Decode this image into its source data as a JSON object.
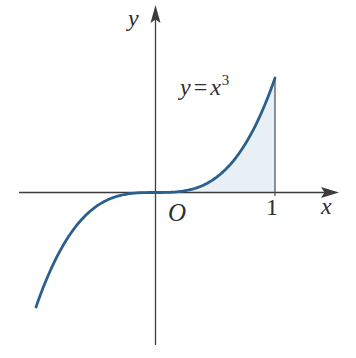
{
  "figure": {
    "axis_labels": {
      "x": "x",
      "y": "y"
    },
    "origin_label": "O",
    "x_tick_label": "1",
    "equation": {
      "lhs": "y",
      "equals": "=",
      "rhs_base": "x",
      "rhs_exponent": "3"
    }
  },
  "colors": {
    "background": "#ffffff",
    "curve": "#2b5f8e",
    "area_fill": "#e8eff5",
    "axis": "#3c3c3c",
    "text": "#2e2e2e"
  },
  "chart_data": {
    "type": "line",
    "title": "",
    "function": "y = x^3",
    "exponent": 3,
    "x_range": [
      -1,
      1
    ],
    "series": [
      {
        "name": "y = x^3",
        "x": [
          -1,
          -0.8,
          -0.6,
          -0.4,
          -0.2,
          0,
          0.2,
          0.4,
          0.6,
          0.8,
          1
        ],
        "y": [
          -1,
          -0.512,
          -0.216,
          -0.064,
          -0.008,
          0,
          0.008,
          0.064,
          0.216,
          0.512,
          1
        ]
      }
    ],
    "x_ticks": [
      {
        "value": 1,
        "label": "1"
      }
    ],
    "y_ticks": [],
    "shaded_region": {
      "description": "area between curve and x-axis, bounded right by the line x = 1",
      "from_x": 0,
      "to_x": 1
    },
    "axes": {
      "x_label": "x",
      "y_label": "y",
      "origin_label": "O"
    },
    "grid": false,
    "legend": false,
    "layout": {
      "origin_px": [
        155.5,
        192.5
      ],
      "px_per_unit_x": 119.5,
      "px_per_unit_y": 114.5,
      "sample_step": 0.01,
      "x_axis_px": [
        19,
        335
      ],
      "y_axis_px": [
        345,
        9
      ]
    }
  }
}
